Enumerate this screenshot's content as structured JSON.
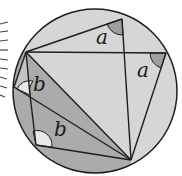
{
  "diagram": {
    "type": "inscribed-angles",
    "labels": {
      "angle_a_top": "a",
      "angle_a_right": "a",
      "angle_b_upper": "b",
      "angle_b_lower": "b"
    },
    "colors": {
      "circle_fill": "#d6d6d6",
      "dark_region": "#a8a8a8",
      "angle_mark_a": "#9e9e9e",
      "angle_mark_b": "#e6e6e6",
      "stroke": "#1e1e1e",
      "hatch": "#444444"
    },
    "points": {
      "T": [
        122,
        19
      ],
      "L": [
        26,
        52
      ],
      "R": [
        166,
        53
      ],
      "B": [
        131,
        160
      ],
      "W": [
        30,
        95
      ],
      "X": [
        36,
        145
      ],
      "E": [
        14,
        87
      ]
    },
    "circle": {
      "cx": 95,
      "cy": 91,
      "r": 82
    }
  }
}
